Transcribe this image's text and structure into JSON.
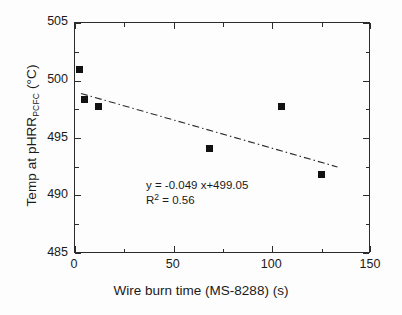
{
  "chart_data": {
    "type": "scatter",
    "title": "",
    "xlabel": "Wire burn time (MS-8288) (s)",
    "ylabel_parts": {
      "pre": "Temp at pHRR",
      "sub": "PCFC",
      "post": " (°C)"
    },
    "ylabel": "Temp at pHRR_PCFC (°C)",
    "xlim": [
      0,
      150
    ],
    "ylim": [
      485,
      505
    ],
    "xticks": [
      0,
      50,
      100,
      150
    ],
    "yticks": [
      485,
      490,
      495,
      500,
      505
    ],
    "xminor_step": 25,
    "yminor_step": 2.5,
    "grid": false,
    "legend": null,
    "marker_style": "filled-square",
    "marker_color": "#111111",
    "frame_color": "#2b2b2b",
    "points": [
      {
        "x": 2.5,
        "y": 501.0
      },
      {
        "x": 5.0,
        "y": 498.4
      },
      {
        "x": 12.0,
        "y": 497.8
      },
      {
        "x": 68.0,
        "y": 494.1
      },
      {
        "x": 104.5,
        "y": 497.8
      },
      {
        "x": 125.0,
        "y": 491.9
      }
    ],
    "fit": {
      "slope": -0.049,
      "intercept": 499.05,
      "r_squared": 0.56,
      "x_start": 3,
      "x_end": 133,
      "line_style": "dash-dot",
      "line_color": "#2b2b2b"
    },
    "annotations": {
      "equation_prefix": "y = -0.049 x+499.05",
      "r2_label": "R",
      "r2_sup": "2",
      "r2_value": " = 0.56"
    }
  },
  "axis": {
    "x_tick_labels": [
      "0",
      "50",
      "100",
      "150"
    ],
    "y_tick_labels": [
      "485",
      "490",
      "495",
      "500",
      "505"
    ]
  }
}
